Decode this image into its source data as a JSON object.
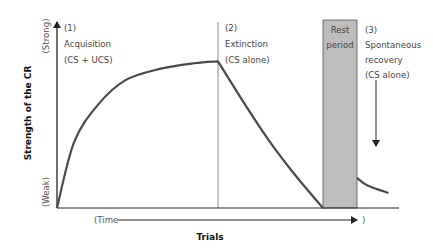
{
  "colors": {
    "curve": "#4a4a4a",
    "axis": "#222222",
    "divider": "#8c8c8c",
    "rest_fill": "#bdbdbd",
    "rest_stroke": "#555555",
    "text": "#444444"
  },
  "axes": {
    "y_title": "Strength of the CR",
    "y_top_label": "(Strong)",
    "y_bottom_label": "(Weak)",
    "x_title": "Trials",
    "time_label_open": "(Time",
    "time_label_close": ")"
  },
  "phases": [
    {
      "number": "(1)",
      "name": "Acquisition",
      "condition": "(CS + UCS)"
    },
    {
      "number": "(2)",
      "name": "Extinction",
      "condition": "(CS alone)"
    },
    {
      "number": "(3)",
      "name_line1": "Spontaneous",
      "name_line2": "recovery",
      "condition": "(CS alone)"
    }
  ],
  "rest_period": {
    "line1": "Rest",
    "line2": "period"
  },
  "chart_data": {
    "type": "line",
    "title": "",
    "xlabel": "Trials",
    "ylabel": "Strength of the CR",
    "ylim_labels": [
      "(Weak)",
      "(Strong)"
    ],
    "x_range": [
      0,
      100
    ],
    "y_range": [
      0,
      1
    ],
    "series": [
      {
        "name": "Acquisition",
        "x": [
          0,
          5,
          12,
          20,
          30,
          40,
          47
        ],
        "y": [
          0,
          0.35,
          0.55,
          0.68,
          0.74,
          0.77,
          0.78
        ]
      },
      {
        "name": "Extinction",
        "x": [
          47,
          55,
          62,
          70,
          78
        ],
        "y": [
          0.78,
          0.55,
          0.36,
          0.17,
          0
        ]
      },
      {
        "name": "Spontaneous recovery",
        "x": [
          88,
          91,
          97
        ],
        "y": [
          0.16,
          0.12,
          0.08
        ]
      }
    ],
    "regions": [
      {
        "name": "Rest period",
        "x_start": 78,
        "x_end": 88
      }
    ],
    "dividers": [
      47
    ],
    "grid": false,
    "legend": "none"
  }
}
